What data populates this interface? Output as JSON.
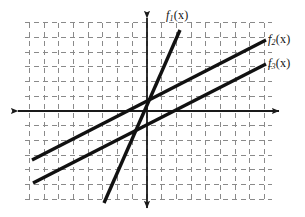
{
  "figure": {
    "background_color": "#ffffff",
    "width": 305,
    "height": 217
  },
  "axes": {
    "origin_px": {
      "x": 147,
      "y": 111
    },
    "unit_px": 14.7,
    "x_axis": {
      "name": "x-axis",
      "color": "#1a1a1a",
      "start_px": {
        "x": 18,
        "y": 111
      },
      "end_px": {
        "x": 279,
        "y": 111
      },
      "arrowheads": "both"
    },
    "y_axis": {
      "name": "y-axis",
      "color": "#1a1a1a",
      "start_px": {
        "x": 147,
        "y": 18
      },
      "end_px": {
        "x": 147,
        "y": 208
      },
      "arrowheads": "both"
    },
    "grid": {
      "style": "dashed",
      "color": "#8a8a8a",
      "left_px": 25,
      "right_px": 272,
      "top_px": 23,
      "bottom_px": 200,
      "spacing_px": 14.7,
      "dash_pattern": "5,4"
    }
  },
  "labels": [
    {
      "name": "function-label-f1",
      "base": "f",
      "sub": "1",
      "arg": "(x)",
      "x_px": 166,
      "y_px": 9
    },
    {
      "name": "function-label-f2",
      "base": "f",
      "sub": "2",
      "arg": "(x)",
      "x_px": 268,
      "y_px": 33
    },
    {
      "name": "function-label-f3",
      "base": "f",
      "sub": "3",
      "arg": "(x)",
      "x_px": 268,
      "y_px": 57
    }
  ],
  "chart_data": {
    "type": "line",
    "xlabel": "x",
    "ylabel": "y",
    "xlim": [
      -8.3,
      8.5
    ],
    "ylim": [
      -6.6,
      6.3
    ],
    "grid": true,
    "legend": "inline-end-labels",
    "series": [
      {
        "name": "f1(x)",
        "label": "f₁(x)",
        "color": "#111111",
        "width_px": 3.4,
        "slope": 2.3,
        "intercept": 0.35,
        "x": [
          -2.95,
          2.25
        ],
        "y": [
          -6.3,
          5.5
        ],
        "px": [
          {
            "x": 104,
            "y": 203
          },
          {
            "x": 180,
            "y": 30
          }
        ]
      },
      {
        "name": "f2(x)",
        "label": "f₂(x)",
        "color": "#111111",
        "width_px": 3.4,
        "slope": 0.51,
        "intercept": 0.85,
        "x": [
          -7.8,
          8.1
        ],
        "y": [
          -3.35,
          4.85
        ],
        "px": [
          {
            "x": 32,
            "y": 160
          },
          {
            "x": 266,
            "y": 40
          }
        ]
      },
      {
        "name": "f3(x)",
        "label": "f₃(x)",
        "color": "#111111",
        "width_px": 3.4,
        "slope": 0.51,
        "intercept": -0.8,
        "x": [
          -7.75,
          8.1
        ],
        "y": [
          -4.9,
          3.2
        ],
        "px": [
          {
            "x": 33,
            "y": 183
          },
          {
            "x": 266,
            "y": 64
          }
        ]
      }
    ]
  }
}
